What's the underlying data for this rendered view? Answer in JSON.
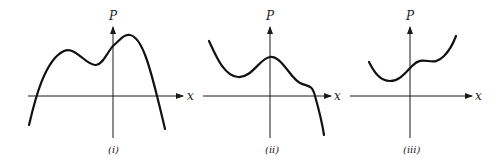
{
  "panels": [
    {
      "id": "i",
      "caption": "(i)",
      "y_label": "P",
      "x_label": "x",
      "description": "Quartic-like curve with two local maxima (right higher) and one local minimum, both ends going down; crosses x-axis twice"
    },
    {
      "id": "ii",
      "caption": "(ii)",
      "y_label": "P",
      "x_label": "x",
      "description": "Curve decreasing from upper left to a local minimum, rising to a local maximum on the P-axis, then a flat inflection shoulder, then falling steeply across the x-axis"
    },
    {
      "id": "iii",
      "caption": "(iii)",
      "y_label": "P",
      "x_label": "x",
      "description": "Curve with a local minimum left of the P-axis, then a flat inflection shoulder, then rising to the upper right; stays above the x-axis"
    }
  ],
  "colors": {
    "curve": "#111111",
    "axis": "#1a1a1a",
    "background": "#ffffff"
  }
}
